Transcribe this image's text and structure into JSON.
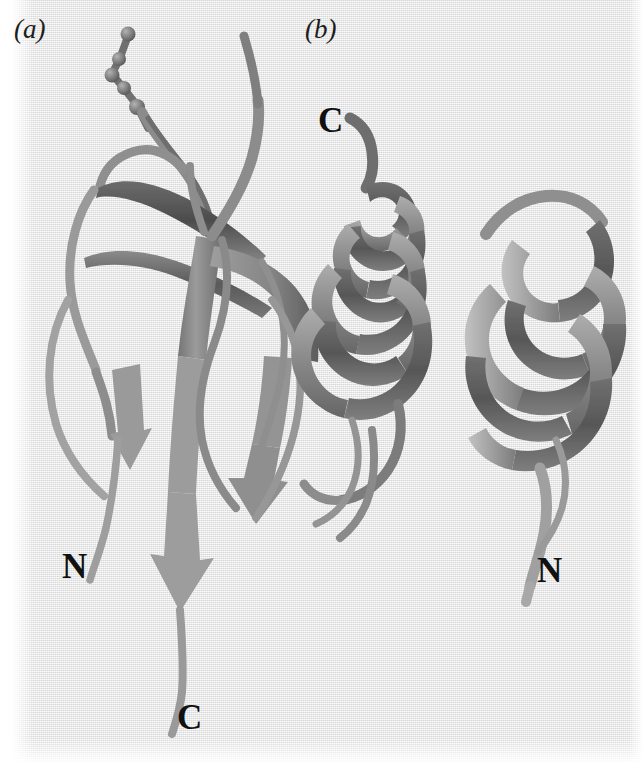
{
  "figure": {
    "kind": "protein-ribbon-diagram",
    "background_color": "#ebeaea",
    "ink_color": "#111111",
    "width": 643,
    "height": 764
  },
  "panels": [
    {
      "id": "a",
      "label": "(a)",
      "fold": "beta-sheet",
      "description": "Ribbon diagram of an all-beta domain with antiparallel beta strands drawn as flat arrows, plus a ball-and-stick side chain at the top.",
      "terminus_labels": {
        "n": "N",
        "c": "C"
      },
      "ribbon_colors": {
        "front": "#8e8e8e",
        "back": "#5f5f5f",
        "edge": "#4a4a4a"
      }
    },
    {
      "id": "b",
      "label": "(b)",
      "fold": "alpha-helical",
      "description": "Ribbon diagram of an all-alpha domain showing two alpha helices drawn as coiled flat ribbons.",
      "terminus_labels": {
        "c": "C",
        "n": "N"
      },
      "ribbon_colors": {
        "front": "#9a9a9a",
        "back": "#636363",
        "edge": "#4f4f4f"
      }
    }
  ],
  "labels": {
    "panel_a": "(a)",
    "panel_b": "(b)",
    "panel_a_n": "N",
    "panel_a_c": "C",
    "panel_b_c": "C",
    "panel_b_n": "N"
  }
}
